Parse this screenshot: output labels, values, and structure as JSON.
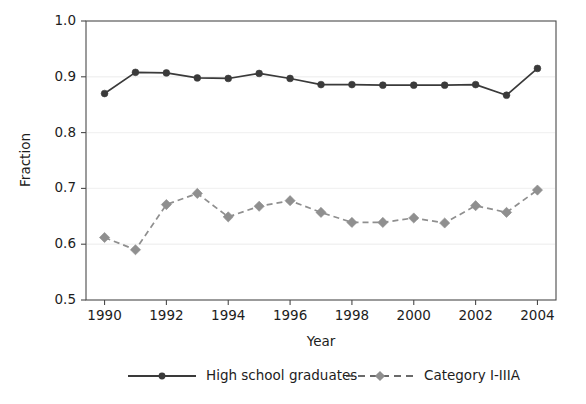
{
  "chart_data": {
    "type": "line",
    "title": "",
    "xlabel": "Year",
    "ylabel": "Fraction",
    "xlim": [
      1989.4,
      2004.6
    ],
    "ylim": [
      0.5,
      1.0
    ],
    "xticks": [
      1990,
      1992,
      1994,
      1996,
      1998,
      2000,
      2002,
      2004
    ],
    "xtick_labels": [
      "1990",
      "1992",
      "1994",
      "1996",
      "1998",
      "2000",
      "2002",
      "2004"
    ],
    "yticks": [
      0.5,
      0.6,
      0.7,
      0.8,
      0.9,
      1.0
    ],
    "ytick_labels": [
      "0.5",
      "0.6",
      "0.7",
      "0.8",
      "0.9",
      "1.0"
    ],
    "grid": "horizontal",
    "legend_position": "bottom",
    "x": [
      1990,
      1991,
      1992,
      1993,
      1994,
      1995,
      1996,
      1997,
      1998,
      1999,
      2000,
      2001,
      2002,
      2003,
      2004
    ],
    "series": [
      {
        "name": "High school graduates",
        "color": "#3a3a3a",
        "marker": "circle",
        "linestyle": "solid",
        "values": [
          0.87,
          0.908,
          0.907,
          0.898,
          0.897,
          0.906,
          0.897,
          0.886,
          0.886,
          0.885,
          0.885,
          0.885,
          0.886,
          0.867,
          0.915
        ]
      },
      {
        "name": "Category I-IIIA",
        "color": "#8f8f8f",
        "marker": "diamond",
        "linestyle": "dashed",
        "values": [
          0.612,
          0.59,
          0.671,
          0.691,
          0.649,
          0.668,
          0.678,
          0.657,
          0.639,
          0.639,
          0.647,
          0.638,
          0.669,
          0.657,
          0.697
        ]
      }
    ]
  },
  "legend": {
    "items": [
      {
        "label": "High school graduates"
      },
      {
        "label": "Category I-IIIA"
      }
    ]
  },
  "colors": {
    "series_primary": "#3a3a3a",
    "series_secondary": "#8f8f8f",
    "frame": "#4a4a4a",
    "grid": "#f2f2f2",
    "text": "#1d1d1d",
    "background": "#ffffff"
  }
}
